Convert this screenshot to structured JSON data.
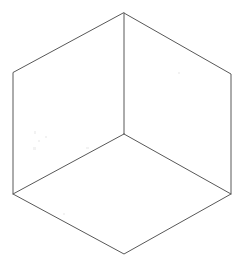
{
  "figure": {
    "name": "isometric-cube-hexagon",
    "title": "Hexagon with three center spokes (isometric cube outline)",
    "background_color": "#ffffff",
    "stroke_color": "#585858",
    "stroke_width": 1,
    "canvas": {
      "width": 242,
      "height": 265
    },
    "vertices": {
      "top": {
        "x": 124,
        "y": 13
      },
      "upper_right": {
        "x": 231,
        "y": 74
      },
      "lower_right": {
        "x": 231,
        "y": 194
      },
      "bottom": {
        "x": 124,
        "y": 254
      },
      "lower_left": {
        "x": 13,
        "y": 194
      },
      "upper_left": {
        "x": 13,
        "y": 73
      },
      "center": {
        "x": 124,
        "y": 134
      }
    },
    "outline_points": "124,13 231,74 231,194 124,254 13,194 13,73",
    "spokes": [
      {
        "name": "spoke-to-top",
        "x1": 124,
        "y1": 134,
        "x2": 124,
        "y2": 13
      },
      {
        "name": "spoke-to-lower-left",
        "x1": 124,
        "y1": 134,
        "x2": 13,
        "y2": 194
      },
      {
        "name": "spoke-to-lower-right",
        "x1": 124,
        "y1": 134,
        "x2": 231,
        "y2": 194
      }
    ],
    "edges": [
      {
        "name": "edge-top-left",
        "x1": 124,
        "y1": 13,
        "x2": 13,
        "y2": 73
      },
      {
        "name": "edge-top-right",
        "x1": 124,
        "y1": 13,
        "x2": 231,
        "y2": 74
      },
      {
        "name": "edge-right-vertical",
        "x1": 231,
        "y1": 74,
        "x2": 231,
        "y2": 194
      },
      {
        "name": "edge-bottom-right",
        "x1": 231,
        "y1": 194,
        "x2": 124,
        "y2": 254
      },
      {
        "name": "edge-bottom-left",
        "x1": 124,
        "y1": 254,
        "x2": 13,
        "y2": 194
      },
      {
        "name": "edge-left-vertical",
        "x1": 13,
        "y1": 194,
        "x2": 13,
        "y2": 73
      }
    ],
    "speckles": [
      {
        "x": 34,
        "y": 131,
        "w": 2,
        "h": 3
      },
      {
        "x": 38,
        "y": 140,
        "w": 2,
        "h": 2
      },
      {
        "x": 33,
        "y": 147,
        "w": 3,
        "h": 3
      },
      {
        "x": 45,
        "y": 136,
        "w": 2,
        "h": 2
      },
      {
        "x": 86,
        "y": 147,
        "w": 3,
        "h": 2
      },
      {
        "x": 178,
        "y": 72,
        "w": 2,
        "h": 2
      },
      {
        "x": 63,
        "y": 213,
        "w": 2,
        "h": 2
      }
    ]
  }
}
